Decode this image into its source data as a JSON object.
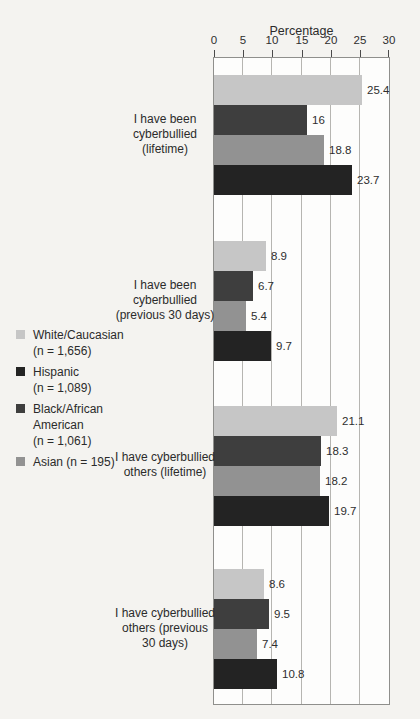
{
  "chart_data": {
    "type": "bar",
    "orientation": "horizontal",
    "xlabel": "Percentage",
    "xlim": [
      0,
      30
    ],
    "x_ticks": [
      0,
      5,
      10,
      15,
      20,
      25,
      30
    ],
    "grid": true,
    "legend_position": "left",
    "categories": [
      [
        "I have been",
        "cyberbullied",
        "(lifetime)"
      ],
      [
        "I have been",
        "cyberbullied",
        "(previous 30 days)"
      ],
      [
        "I have cyberbullied",
        "others (lifetime)"
      ],
      [
        "I have cyberbullied",
        "others (previous",
        "30 days)"
      ]
    ],
    "series": [
      {
        "name": "White/Caucasian",
        "n": "1,656",
        "color": "#c6c6c6",
        "values": [
          25.4,
          8.9,
          21.1,
          8.6
        ],
        "value_labels": [
          "25.4",
          "8.9",
          "21.1",
          "8.6"
        ]
      },
      {
        "name": "Black/African American",
        "n": "1,061",
        "color": "#3e3e3e",
        "values": [
          16,
          6.7,
          18.3,
          9.5
        ],
        "value_labels": [
          "16",
          "6.7",
          "18.3",
          "9.5"
        ]
      },
      {
        "name": "Asian",
        "n": "195",
        "color": "#929292",
        "values": [
          18.8,
          5.4,
          18.2,
          7.4
        ],
        "value_labels": [
          "18.8",
          "5.4",
          "18.2",
          "7.4"
        ]
      },
      {
        "name": "Hispanic",
        "n": "1,089",
        "color": "#232323",
        "values": [
          23.7,
          9.7,
          19.7,
          10.8
        ],
        "value_labels": [
          "23.7",
          "9.7",
          "19.7",
          "10.8"
        ]
      }
    ]
  },
  "legend": {
    "items": [
      {
        "label_lines": [
          "White/Caucasian",
          "(n = 1,656)"
        ],
        "color": "#c6c6c6"
      },
      {
        "label_lines": [
          "Hispanic",
          "(n = 1,089)"
        ],
        "color": "#232323"
      },
      {
        "label_lines": [
          "Black/African",
          "American",
          "(n = 1,061)"
        ],
        "color": "#3e3e3e"
      },
      {
        "label_lines": [
          "Asian (n = 195)"
        ],
        "color": "#929292"
      }
    ]
  }
}
